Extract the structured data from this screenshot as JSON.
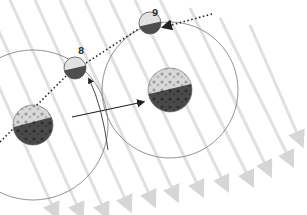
{
  "diagram": {
    "type": "moon-phase-orbit-illustration",
    "colors": {
      "sun_ray": "#dcdcdc",
      "orbit": "#777777",
      "arrow": "#333333",
      "dotted": "#222222",
      "earth_day": "#cfcfcf",
      "earth_night": "#444444",
      "moon_day": "#e4e4e4",
      "moon_night": "#505050"
    },
    "earths": [
      {
        "id": "earth-left",
        "cx": 33,
        "cy": 125,
        "r": 20,
        "orbit_r": 75
      },
      {
        "id": "earth-right",
        "cx": 170,
        "cy": 90,
        "r": 22,
        "orbit_r": 68
      }
    ],
    "moons": [
      {
        "id": "moon-8",
        "label": "8",
        "cx": 75,
        "cy": 68,
        "r": 11
      },
      {
        "id": "moon-9",
        "label": "9",
        "cx": 150,
        "cy": 23,
        "r": 11
      }
    ]
  }
}
